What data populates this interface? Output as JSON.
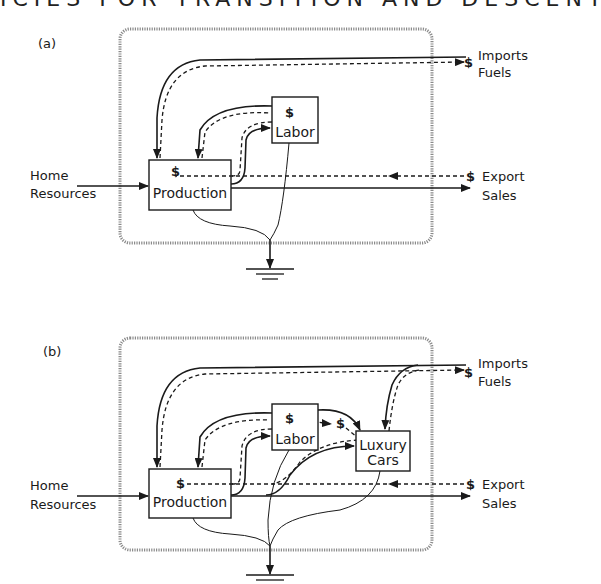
{
  "header": {
    "text": "ICIES FOR TRANSITION AND DESCENT"
  },
  "panels": [
    {
      "id": "a",
      "label": "(a)",
      "boxes": {
        "production": "Production",
        "labor": "Labor"
      },
      "money_symbol": "$",
      "left_input": {
        "line1": "Home",
        "line2": "Resources"
      },
      "imports": {
        "line1": "Imports",
        "line2": "Fuels"
      },
      "exports": {
        "line1": "Export",
        "line2": "Sales"
      }
    },
    {
      "id": "b",
      "label": "(b)",
      "boxes": {
        "production": "Production",
        "labor": "Labor",
        "luxury_line1": "Luxury",
        "luxury_line2": "Cars"
      },
      "money_symbol": "$",
      "left_input": {
        "line1": "Home",
        "line2": "Resources"
      },
      "imports": {
        "line1": "Imports",
        "line2": "Fuels"
      },
      "exports": {
        "line1": "Export",
        "line2": "Sales"
      }
    }
  ],
  "legend": {
    "solid_line": "energy/material flow",
    "dashed_line": "money flow",
    "ground_symbol": "heat sink"
  },
  "colors": {
    "ink": "#1a1a1a",
    "frame": "#8a8a8a",
    "background": "#ffffff"
  }
}
